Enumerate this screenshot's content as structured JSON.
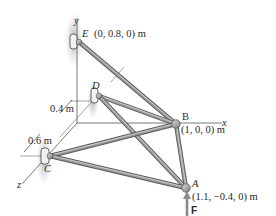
{
  "figure": {
    "type": "3D space truss diagram",
    "axes": {
      "x": "x",
      "y": "y",
      "z": "z"
    },
    "points": {
      "E": {
        "label": "E",
        "coord": "(0, 0.8, 0) m"
      },
      "D": {
        "label": "D"
      },
      "B": {
        "label": "B",
        "coord": "(1, 0, 0) m"
      },
      "C": {
        "label": "C"
      },
      "A": {
        "label": "A",
        "coord": "(1.1, −0.4, 0) m"
      }
    },
    "dimensions": {
      "d1": "0.4 m",
      "d2": "0.6 m"
    },
    "force": {
      "label": "F"
    },
    "members": [
      [
        "E",
        "B"
      ],
      [
        "D",
        "B"
      ],
      [
        "D",
        "A"
      ],
      [
        "C",
        "B"
      ],
      [
        "C",
        "A"
      ],
      [
        "B",
        "A"
      ]
    ],
    "supports": [
      "E",
      "D",
      "C"
    ],
    "colors": {
      "member": "#9a9a9a",
      "member_edge": "#5a5a5a",
      "support_shadow": "#bdbdbd",
      "axis": "#555555",
      "text": "#2a2a2a"
    }
  }
}
